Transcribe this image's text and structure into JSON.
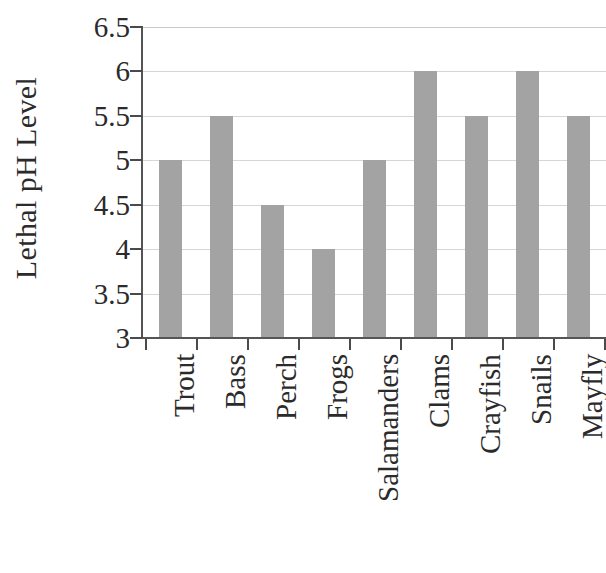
{
  "chart_data": {
    "type": "bar",
    "title": "",
    "xlabel": "",
    "ylabel": "Lethal pH Level",
    "categories": [
      "Trout",
      "Bass",
      "Perch",
      "Frogs",
      "Salamanders",
      "Clams",
      "Crayfish",
      "Snails",
      "Mayfly"
    ],
    "values": [
      5,
      5.5,
      4.5,
      4,
      5,
      6,
      5.5,
      6,
      5.5
    ],
    "ylim": [
      3,
      6.5
    ],
    "yticks": [
      3,
      3.5,
      4,
      4.5,
      5,
      5.5,
      6,
      6.5
    ],
    "ytick_labels": [
      "3",
      "3.5",
      "4",
      "4.5",
      "5",
      "5.5",
      "6",
      "6.5"
    ],
    "grid": true,
    "legend": "none",
    "bar_color": "#a3a3a3",
    "gridline_color": "#d6d6d6",
    "axis_color": "#555555",
    "background_color": "#ffffff"
  }
}
